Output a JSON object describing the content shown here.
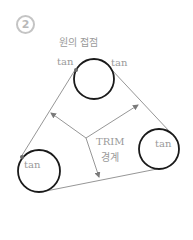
{
  "step_badge": "2",
  "title": "원의 접점",
  "labels": {
    "tan_top_left": "tan",
    "tan_top_right": "tan",
    "tan_bottom_left": "tan",
    "tan_bottom_right": "tan",
    "trim_line1": "TRIM",
    "trim_line2": "경계"
  },
  "colors": {
    "circle_stroke": "#1a1a1a",
    "line_stroke": "#8a8a8a",
    "label_text": "#9a9a9a",
    "badge": "#c4c4c4"
  },
  "circles": [
    {
      "name": "top",
      "cx": 94,
      "cy": 79,
      "r": 20
    },
    {
      "name": "bottom-left",
      "cx": 39,
      "cy": 171,
      "r": 21
    },
    {
      "name": "bottom-right",
      "cx": 159,
      "cy": 149,
      "r": 20
    }
  ]
}
